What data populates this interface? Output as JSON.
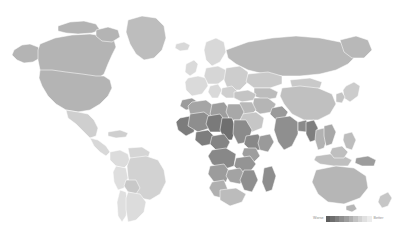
{
  "figure": {
    "type": "choropleth-world-map",
    "background_color": "#ffffff",
    "border_color": "#ffffff",
    "no_data_color": "#ffffff"
  },
  "legend": {
    "low_label": "Worse",
    "high_label": "Better",
    "orientation": "horizontal",
    "position": "bottom-right",
    "swatches": [
      "#5f5f5f",
      "#6e6e6e",
      "#7e7e7e",
      "#8e8e8e",
      "#9e9e9e",
      "#b0b0b0",
      "#c2c2c2",
      "#d2d2d2",
      "#e0e0e0",
      "#ececec"
    ]
  },
  "chart_data": {
    "type": "heatmap",
    "title": "",
    "xlabel": "",
    "ylabel": "",
    "legend_low": "Worse",
    "legend_high": "Better",
    "colorscale": [
      "#5f5f5f",
      "#6e6e6e",
      "#7e7e7e",
      "#8e8e8e",
      "#9e9e9e",
      "#b0b0b0",
      "#c2c2c2",
      "#d2d2d2",
      "#e0e0e0",
      "#ececec"
    ],
    "regions": [
      {
        "name": "Canada",
        "color": "#b4b4b4"
      },
      {
        "name": "United States",
        "color": "#b4b4b4"
      },
      {
        "name": "Greenland",
        "color": "#bdbdbd"
      },
      {
        "name": "Mexico",
        "color": "#cfcfcf"
      },
      {
        "name": "Central America",
        "color": "#d8d8d8"
      },
      {
        "name": "Caribbean",
        "color": "#cfcfcf"
      },
      {
        "name": "Colombia",
        "color": "#dcdcdc"
      },
      {
        "name": "Venezuela",
        "color": "#d5d5d5"
      },
      {
        "name": "Brazil",
        "color": "#d2d2d2"
      },
      {
        "name": "Peru",
        "color": "#dedede"
      },
      {
        "name": "Bolivia",
        "color": "#c8c8c8"
      },
      {
        "name": "Chile",
        "color": "#dfdfdf"
      },
      {
        "name": "Argentina",
        "color": "#dcdcdc"
      },
      {
        "name": "Western Europe",
        "color": "#dadada"
      },
      {
        "name": "Scandinavia",
        "color": "#d8d8d8"
      },
      {
        "name": "Eastern Europe",
        "color": "#cdcdcd"
      },
      {
        "name": "Russia",
        "color": "#b8b8b8"
      },
      {
        "name": "Turkey",
        "color": "#c4c4c4"
      },
      {
        "name": "Middle East",
        "color": "#b9b9b9"
      },
      {
        "name": "Saudi Arabia",
        "color": "#c6c6c6"
      },
      {
        "name": "Iran",
        "color": "#b5b5b5"
      },
      {
        "name": "Kazakhstan",
        "color": "#c9c9c9"
      },
      {
        "name": "Central Asia",
        "color": "#bcbcbc"
      },
      {
        "name": "China",
        "color": "#c0c0c0"
      },
      {
        "name": "Mongolia",
        "color": "#c9c9c9"
      },
      {
        "name": "Japan",
        "color": "#cccccc"
      },
      {
        "name": "Korea",
        "color": "#c4c4c4"
      },
      {
        "name": "India",
        "color": "#8f8f8f"
      },
      {
        "name": "Pakistan",
        "color": "#9a9a9a"
      },
      {
        "name": "Bangladesh",
        "color": "#8a8a8a"
      },
      {
        "name": "Myanmar",
        "color": "#7f7f7f"
      },
      {
        "name": "Thailand",
        "color": "#b2b2b2"
      },
      {
        "name": "Vietnam",
        "color": "#a8a8a8"
      },
      {
        "name": "Indonesia",
        "color": "#bfbfbf"
      },
      {
        "name": "Philippines",
        "color": "#bdbdbd"
      },
      {
        "name": "Australia",
        "color": "#b6b6b6"
      },
      {
        "name": "New Zealand",
        "color": "#c6c6c6"
      },
      {
        "name": "Papua New Guinea",
        "color": "#9d9d9d"
      },
      {
        "name": "Morocco",
        "color": "#9b9b9b"
      },
      {
        "name": "Algeria",
        "color": "#a5a5a5"
      },
      {
        "name": "Libya",
        "color": "#9d9d9d"
      },
      {
        "name": "Egypt",
        "color": "#a8a8a8"
      },
      {
        "name": "Sudan",
        "color": "#8b8b8b"
      },
      {
        "name": "Mali",
        "color": "#8e8e8e"
      },
      {
        "name": "Niger",
        "color": "#7a7a7a"
      },
      {
        "name": "Chad",
        "color": "#6f6f6f"
      },
      {
        "name": "Nigeria",
        "color": "#7d7d7d"
      },
      {
        "name": "Ethiopia",
        "color": "#888888"
      },
      {
        "name": "Somalia",
        "color": "#9a9a9a"
      },
      {
        "name": "Kenya",
        "color": "#9e9e9e"
      },
      {
        "name": "Tanzania",
        "color": "#949494"
      },
      {
        "name": "DR Congo",
        "color": "#888888"
      },
      {
        "name": "Angola",
        "color": "#9c9c9c"
      },
      {
        "name": "Zambia",
        "color": "#a3a3a3"
      },
      {
        "name": "Mozambique",
        "color": "#8f8f8f"
      },
      {
        "name": "Madagascar",
        "color": "#8d8d8d"
      },
      {
        "name": "South Africa",
        "color": "#bcbcbc"
      },
      {
        "name": "Namibia",
        "color": "#b0b0b0"
      },
      {
        "name": "West Africa Coast",
        "color": "#7c7c7c"
      }
    ]
  }
}
